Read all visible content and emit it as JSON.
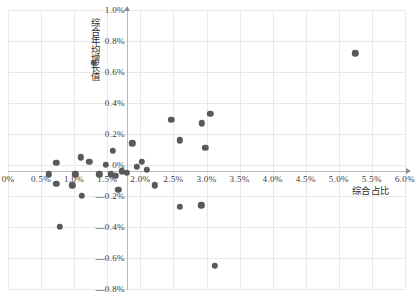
{
  "chart_data": {
    "type": "scatter",
    "title": "",
    "xlabel": "综合占比",
    "ylabel": "综合年均增长值",
    "xlim": [
      0,
      6.0
    ],
    "ylim": [
      -0.8,
      1.0
    ],
    "xunit": "%",
    "yunit": "%",
    "grid": true,
    "legend": "none",
    "marker_color": "#595959",
    "xticks": [
      "0%",
      "0.5%",
      "1.0%",
      "1.5%",
      "2.0%",
      "2.5%",
      "3.0%",
      "3.5%",
      "4.0%",
      "4.5%",
      "5.0%",
      "5.5%",
      "6.0%"
    ],
    "xtick_values": [
      0,
      0.5,
      1.0,
      1.5,
      2.0,
      2.5,
      3.0,
      3.5,
      4.0,
      4.5,
      5.0,
      5.5,
      6.0
    ],
    "yticks": [
      "1.0%",
      "0.8%",
      "0.6%",
      "0.4%",
      "0.2%",
      "0%",
      "—0.2%",
      "—0.4%",
      "—0.6%",
      "—0.8%"
    ],
    "ytick_values": [
      1.0,
      0.8,
      0.6,
      0.4,
      0.2,
      0,
      -0.2,
      -0.4,
      -0.6,
      -0.8
    ],
    "points": [
      {
        "x": 1.3,
        "y": 0.66
      },
      {
        "x": 5.25,
        "y": 0.72
      },
      {
        "x": 2.47,
        "y": 0.29
      },
      {
        "x": 2.93,
        "y": 0.27
      },
      {
        "x": 3.06,
        "y": 0.33
      },
      {
        "x": 2.6,
        "y": 0.16
      },
      {
        "x": 2.98,
        "y": 0.11
      },
      {
        "x": 1.58,
        "y": 0.09
      },
      {
        "x": 1.88,
        "y": 0.14
      },
      {
        "x": 1.1,
        "y": 0.05
      },
      {
        "x": 1.23,
        "y": 0.02
      },
      {
        "x": 0.73,
        "y": 0.015
      },
      {
        "x": 1.48,
        "y": 0.0
      },
      {
        "x": 1.95,
        "y": -0.01
      },
      {
        "x": 2.02,
        "y": 0.02
      },
      {
        "x": 2.1,
        "y": -0.03
      },
      {
        "x": 1.72,
        "y": -0.04
      },
      {
        "x": 1.8,
        "y": -0.05
      },
      {
        "x": 0.62,
        "y": -0.06
      },
      {
        "x": 1.02,
        "y": -0.06
      },
      {
        "x": 1.38,
        "y": -0.06
      },
      {
        "x": 1.55,
        "y": -0.06
      },
      {
        "x": 1.62,
        "y": -0.07
      },
      {
        "x": 0.73,
        "y": -0.12
      },
      {
        "x": 0.97,
        "y": -0.13
      },
      {
        "x": 2.22,
        "y": -0.13
      },
      {
        "x": 1.67,
        "y": -0.16
      },
      {
        "x": 1.12,
        "y": -0.2
      },
      {
        "x": 2.6,
        "y": -0.27
      },
      {
        "x": 2.92,
        "y": -0.26
      },
      {
        "x": 0.78,
        "y": -0.4
      },
      {
        "x": 3.13,
        "y": -0.65
      }
    ]
  }
}
